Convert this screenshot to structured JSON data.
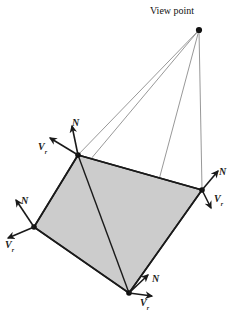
{
  "figure": {
    "title_label": "View point",
    "background_color": "#ffffff",
    "polygon_fill_color": "#cccccc",
    "polygon_edge_color": "#1a1a1a",
    "sight_line_color": "#8c8c8c",
    "vector_color": "#1a1a1a",
    "polygon": {
      "vertices": [
        {
          "name": "top",
          "x": 78,
          "y": 155
        },
        {
          "name": "right",
          "x": 202,
          "y": 190
        },
        {
          "name": "bottom",
          "x": 129,
          "y": 293
        },
        {
          "name": "left",
          "x": 34,
          "y": 227
        }
      ]
    },
    "view_point": {
      "x": 199,
      "y": 30
    },
    "labels": {
      "normal": "N",
      "view_vector": "V",
      "view_vector_subscript": "r"
    },
    "vertex_annotations": [
      {
        "vertex": "top",
        "normal_label": "N",
        "view_label": "V",
        "view_subscript": "r",
        "normal_label_x": 72,
        "normal_label_y": 118,
        "view_label_x": 38,
        "view_label_y": 142
      },
      {
        "vertex": "left",
        "normal_label": "N",
        "view_label": "V",
        "view_subscript": "r",
        "normal_label_x": 21,
        "normal_label_y": 196,
        "view_label_x": 5,
        "view_label_y": 240
      },
      {
        "vertex": "right",
        "normal_label": "N",
        "view_label": "V",
        "view_subscript": "r",
        "normal_label_x": 219,
        "normal_label_y": 167,
        "view_label_x": 214,
        "view_label_y": 194
      },
      {
        "vertex": "bottom",
        "normal_label": "N",
        "view_label": "V",
        "view_subscript": "r",
        "normal_label_x": 152,
        "normal_label_y": 274,
        "view_label_x": 140,
        "view_label_y": 298
      }
    ]
  }
}
